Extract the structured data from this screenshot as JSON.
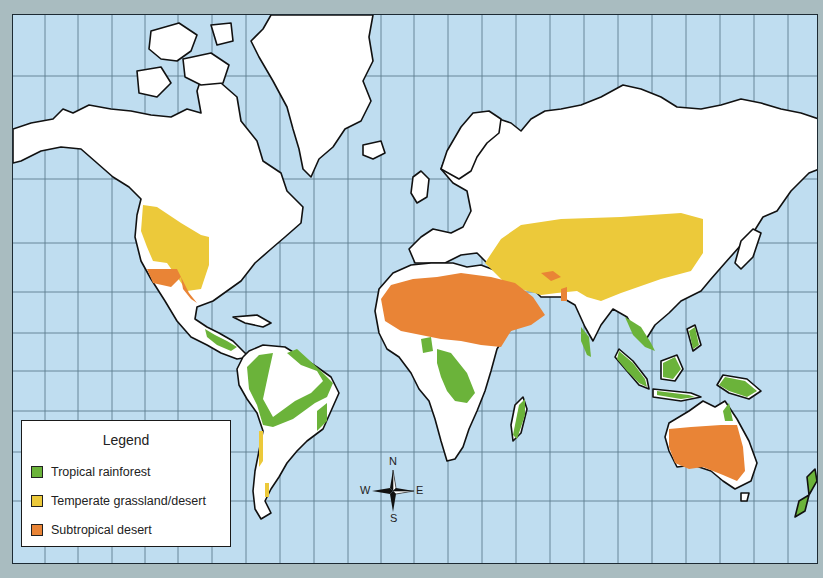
{
  "map": {
    "title": "World biome map",
    "colors": {
      "ocean": "#bfddf0",
      "land": "#ffffff",
      "tropical_rainforest": "#6bb33a",
      "temperate_grassland": "#ecc93a",
      "subtropical_desert": "#e98436",
      "grid": "#5f7d8f",
      "frame": "#a9bcc0"
    }
  },
  "legend": {
    "title": "Legend",
    "items": [
      {
        "label": "Tropical rainforest",
        "color": "#6bb33a"
      },
      {
        "label": "Temperate grassland/desert",
        "color": "#ecc93a"
      },
      {
        "label": "Subtropical desert",
        "color": "#e98436"
      }
    ]
  },
  "compass": {
    "n": "N",
    "e": "E",
    "s": "S",
    "w": "W"
  }
}
